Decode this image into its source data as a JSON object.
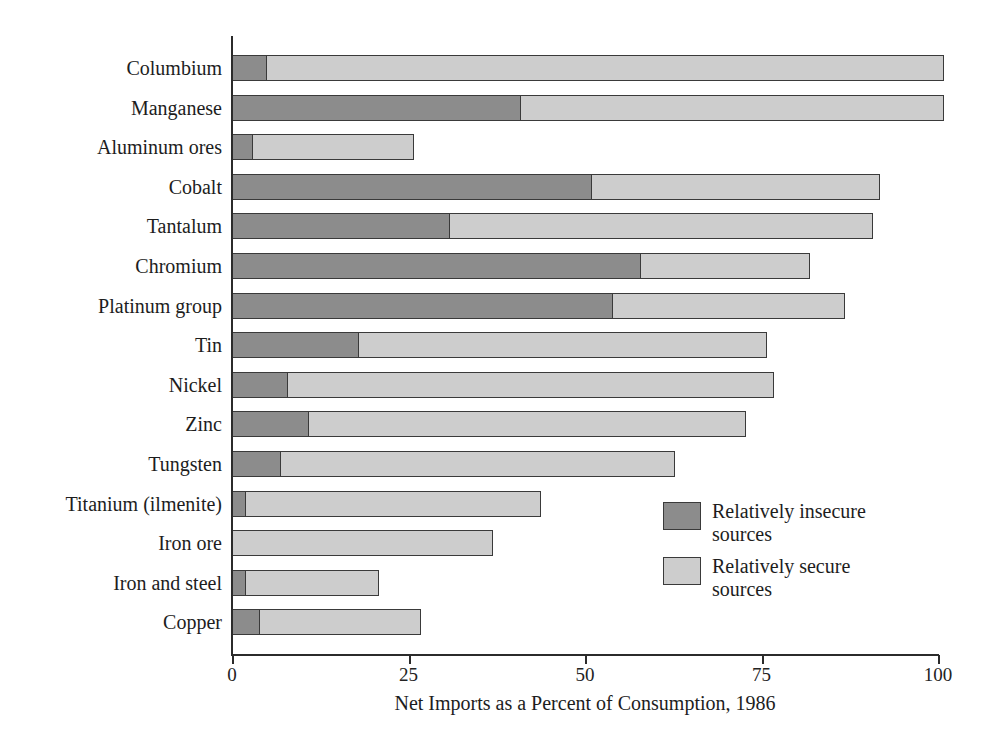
{
  "chart_data": {
    "type": "bar",
    "orientation": "horizontal",
    "stacked": true,
    "title": "",
    "xlabel": "Net Imports as a Percent of Consumption, 1986",
    "ylabel": "",
    "xlim": [
      0,
      100
    ],
    "xticks": [
      0,
      25,
      50,
      75,
      100
    ],
    "xtick_labels": [
      "0",
      "25",
      "50",
      "75",
      "100"
    ],
    "grid": false,
    "legend_position": "inside-right",
    "categories": [
      "Columbium",
      "Manganese",
      "Aluminum ores",
      "Cobalt",
      "Tantalum",
      "Chromium",
      "Platinum group",
      "Tin",
      "Nickel",
      "Zinc",
      "Tungsten",
      "Titanium (ilmenite)",
      "Iron ore",
      "Iron and steel",
      "Copper"
    ],
    "series": [
      {
        "name": "Relatively insecure sources",
        "color": "#8c8c8c",
        "values": [
          5,
          41,
          3,
          51,
          31,
          58,
          54,
          18,
          8,
          11,
          7,
          2,
          0,
          2,
          4
        ]
      },
      {
        "name": "Relatively secure sources",
        "color": "#cdcdcd",
        "values": [
          96,
          60,
          23,
          41,
          60,
          24,
          33,
          58,
          69,
          62,
          56,
          42,
          37,
          19,
          23
        ]
      }
    ],
    "totals": [
      101,
      101,
      26,
      92,
      91,
      82,
      87,
      76,
      77,
      73,
      63,
      44,
      37,
      21,
      27
    ]
  },
  "axis": {
    "x_title": "Net Imports as a Percent of Consumption, 1986",
    "ticks": [
      {
        "value": 0,
        "label": "0"
      },
      {
        "value": 25,
        "label": "25"
      },
      {
        "value": 50,
        "label": "50"
      },
      {
        "value": 75,
        "label": "75"
      },
      {
        "value": 100,
        "label": "100"
      }
    ]
  },
  "legend": {
    "items": [
      {
        "label": "Relatively insecure\nsources",
        "line1": "Relatively insecure",
        "line2": "sources",
        "color": "#8c8c8c",
        "swatch": "dark-gray-swatch"
      },
      {
        "label": "Relatively secure\nsources",
        "line1": "Relatively secure",
        "line2": "sources",
        "color": "#cdcdcd",
        "swatch": "light-gray-swatch"
      }
    ]
  },
  "colors": {
    "insecure": "#8c8c8c",
    "secure": "#cdcdcd",
    "axis": "#2b2b2b",
    "text": "#1d1d1d",
    "background": "#ffffff"
  }
}
